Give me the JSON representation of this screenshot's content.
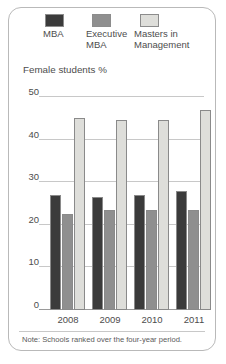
{
  "card": {
    "axis_title": "Female students %",
    "footnote": "Note: Schools ranked over the four-year period."
  },
  "legend": {
    "items": [
      {
        "label": "MBA",
        "color": "#3b3b3b",
        "icon": "legend-swatch-icon"
      },
      {
        "label": "Executive\nMBA",
        "color": "#8f8f8f",
        "icon": "legend-swatch-icon"
      },
      {
        "label": "Masters in\nManagement",
        "color": "#dededa",
        "icon": "legend-swatch-icon"
      }
    ]
  },
  "yaxis": {
    "ticks": [
      "0",
      "10",
      "20",
      "30",
      "40",
      "50"
    ]
  },
  "xaxis": {
    "ticks": [
      "2008",
      "2009",
      "2010",
      "2011"
    ]
  },
  "chart_data": {
    "type": "bar",
    "title": "",
    "subtitle": "",
    "xlabel": "",
    "ylabel": "Female students %",
    "ylim": [
      0,
      50
    ],
    "yticks": [
      0,
      10,
      20,
      30,
      40,
      50
    ],
    "grid": true,
    "legend_position": "top",
    "categories": [
      "2008",
      "2009",
      "2010",
      "2011"
    ],
    "series": [
      {
        "name": "MBA",
        "color": "#3b3b3b",
        "values": [
          27,
          26.5,
          27,
          28
        ]
      },
      {
        "name": "Executive MBA",
        "color": "#8f8f8f",
        "values": [
          22.5,
          23.5,
          23.5,
          23.5
        ]
      },
      {
        "name": "Masters in Management",
        "color": "#dededa",
        "values": [
          45,
          44.5,
          44.5,
          47
        ]
      }
    ],
    "annotations": [
      "Note: Schools ranked over the four-year period."
    ]
  }
}
